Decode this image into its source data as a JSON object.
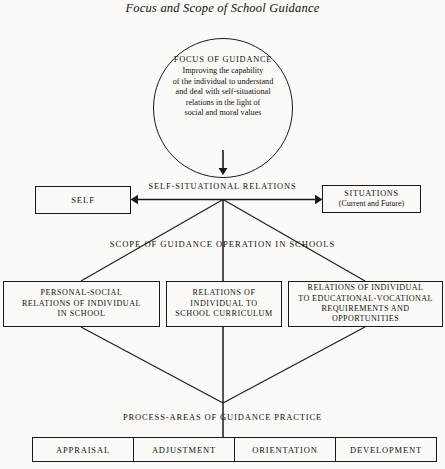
{
  "title": "Focus and Scope of School Guidance",
  "focus_circle": {
    "heading": "FOCUS OF GUIDANCE",
    "body_lines": [
      "Improving the capability",
      "of the individual to understand",
      "and deal with self-situational",
      "relations in the light of",
      "social and moral values"
    ]
  },
  "relations_label": "SELF-SITUATIONAL  RELATIONS",
  "self_box": {
    "label": "SELF"
  },
  "situations_box": {
    "line1": "SITUATIONS",
    "line2": "(Current and Future)"
  },
  "scope_label": "SCOPE OF GUIDANCE OPERATION IN SCHOOLS",
  "scope_boxes": [
    {
      "name": "personal-social",
      "lines": [
        "PERSONAL-SOCIAL",
        "RELATIONS OF INDIVIDUAL",
        "IN SCHOOL"
      ]
    },
    {
      "name": "school-curriculum",
      "lines": [
        "RELATIONS OF",
        "INDIVIDUAL TO",
        "SCHOOL CURRICULUM"
      ]
    },
    {
      "name": "educational-vocational",
      "lines": [
        "RELATIONS OF INDIVIDUAL",
        "TO EDUCATIONAL-VOCATIONAL",
        "REQUIREMENTS AND",
        "OPPORTUNITIES"
      ]
    }
  ],
  "process_label": "PROCESS-AREAS OF GUIDANCE PRACTICE",
  "process_cells": [
    "APPRAISAL",
    "ADJUSTMENT",
    "ORIENTATION",
    "DEVELOPMENT"
  ],
  "colors": {
    "line": "#1a1a1a",
    "background": "#fbfaf7",
    "text": "#111111"
  }
}
